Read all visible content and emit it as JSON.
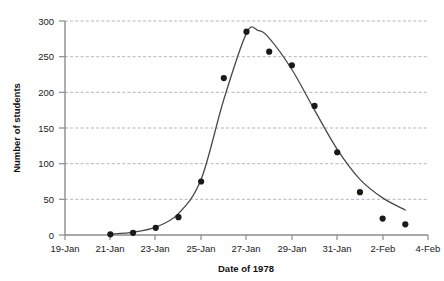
{
  "chart_data": {
    "type": "scatter",
    "title": "",
    "xlabel": "Date of 1978",
    "ylabel": "Number of students",
    "x_tick_labels": [
      "19-Jan",
      "21-Jan",
      "23-Jan",
      "25-Jan",
      "27-Jan",
      "29-Jan",
      "31-Jan",
      "2-Feb",
      "4-Feb"
    ],
    "y_tick_labels": [
      "0",
      "50",
      "100",
      "150",
      "200",
      "250",
      "300"
    ],
    "ylim": [
      0,
      300
    ],
    "xlim_labels": [
      "19-Jan",
      "4-Feb"
    ],
    "grid": "horizontal-dashed",
    "legend": "none",
    "marker_color": "#1a1a1a",
    "line_color": "#4a4a4a",
    "categories": [
      "21-Jan",
      "22-Jan",
      "23-Jan",
      "24-Jan",
      "25-Jan",
      "26-Jan",
      "27-Jan",
      "28-Jan",
      "29-Jan",
      "30-Jan",
      "31-Jan",
      "1-Feb",
      "2-Feb",
      "3-Feb"
    ],
    "values": [
      1,
      3,
      10,
      25,
      75,
      220,
      285,
      257,
      238,
      181,
      116,
      60,
      23,
      15
    ],
    "series": [
      {
        "name": "Number of students",
        "points": [
          {
            "date": "21-Jan",
            "value": 1
          },
          {
            "date": "22-Jan",
            "value": 3
          },
          {
            "date": "23-Jan",
            "value": 10
          },
          {
            "date": "24-Jan",
            "value": 25
          },
          {
            "date": "25-Jan",
            "value": 75
          },
          {
            "date": "26-Jan",
            "value": 220
          },
          {
            "date": "27-Jan",
            "value": 285
          },
          {
            "date": "28-Jan",
            "value": 257
          },
          {
            "date": "29-Jan",
            "value": 238
          },
          {
            "date": "30-Jan",
            "value": 181
          },
          {
            "date": "31-Jan",
            "value": 116
          },
          {
            "date": "1-Feb",
            "value": 60
          },
          {
            "date": "2-Feb",
            "value": 23
          },
          {
            "date": "3-Feb",
            "value": 15
          }
        ]
      },
      {
        "name": "fitted-curve",
        "points": [
          {
            "date": "21-Jan",
            "value": 1
          },
          {
            "date": "22-Jan",
            "value": 4
          },
          {
            "date": "23-Jan",
            "value": 11
          },
          {
            "date": "24-Jan",
            "value": 30
          },
          {
            "date": "25-Jan",
            "value": 78
          },
          {
            "date": "26-Jan",
            "value": 190
          },
          {
            "date": "27-Jan",
            "value": 283
          },
          {
            "date": "27.5-Jan",
            "value": 287
          },
          {
            "date": "28-Jan",
            "value": 276
          },
          {
            "date": "29-Jan",
            "value": 232
          },
          {
            "date": "30-Jan",
            "value": 175
          },
          {
            "date": "31-Jan",
            "value": 120
          },
          {
            "date": "1-Feb",
            "value": 78
          },
          {
            "date": "2-Feb",
            "value": 52
          },
          {
            "date": "3-Feb",
            "value": 35
          }
        ]
      }
    ]
  }
}
